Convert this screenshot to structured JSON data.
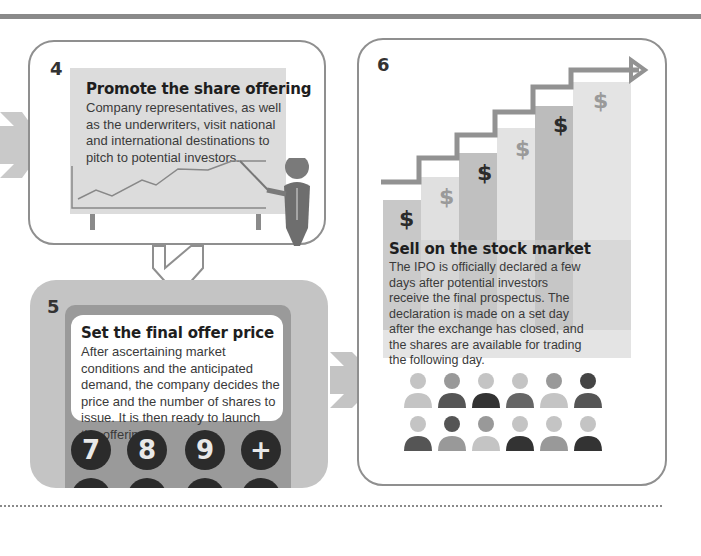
{
  "colors": {
    "border": "#8f8f8f",
    "board": "#dcdcdc",
    "dark": "#2b2b2b",
    "mid": "#9a9a9a",
    "light": "#c7c7c7"
  },
  "step4": {
    "number": "4",
    "title": "Promote the share offering",
    "body": "Company representatives, as well as the underwriters, visit national and international destinations to pitch to potential investors."
  },
  "step5": {
    "number": "5",
    "title": "Set the final offer price",
    "body": "After ascertaining market conditions and the anticipated demand, the company decides the price and the number of shares to issue. It is then ready to launch the offering.",
    "keys": [
      "7",
      "8",
      "9",
      "+"
    ]
  },
  "step6": {
    "number": "6",
    "title": "Sell on the stock market",
    "body": "The IPO is officially declared a few days after potential investors receive the final prospectus. The declaration is made on a set day after the exchange has closed, and the shares are available for trading the following day.",
    "dollar_symbol": "$"
  }
}
